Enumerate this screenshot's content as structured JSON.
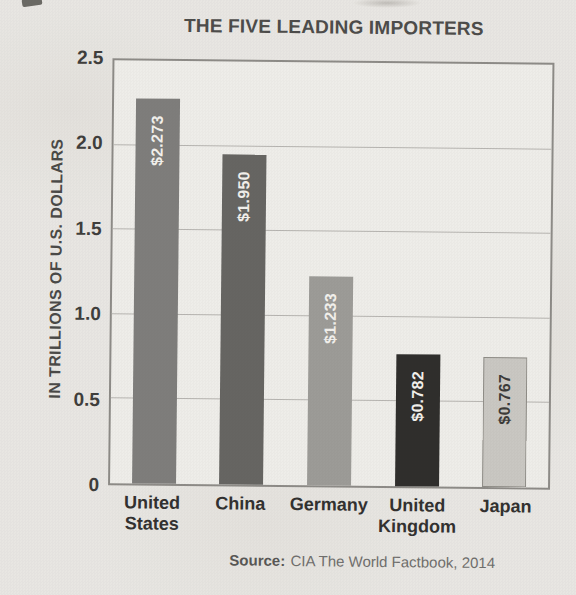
{
  "chart_data": {
    "type": "bar",
    "title": "THE FIVE LEADING IMPORTERS",
    "ylabel": "IN TRILLIONS OF U.S. DOLLARS",
    "xlabel": "",
    "categories": [
      "United States",
      "China",
      "Germany",
      "United Kingdom",
      "Japan"
    ],
    "values": [
      2.273,
      1.95,
      1.233,
      0.782,
      0.767
    ],
    "value_labels": [
      "$2.273",
      "$1.950",
      "$1.233",
      "$0.782",
      "$0.767"
    ],
    "bar_colors": [
      "#7e7d7b",
      "#666562",
      "#9c9b97",
      "#2f2e2c",
      "#c9c7c2"
    ],
    "value_label_colors": [
      "#f2f0ec",
      "#f2f0ec",
      "#f2f0ec",
      "#f2f0ec",
      "#3c3b39"
    ],
    "ylim": [
      0,
      2.5
    ],
    "yticks": [
      {
        "label": "2.5",
        "value": 2.5
      },
      {
        "label": "2.0",
        "value": 2.0
      },
      {
        "label": "1.5",
        "value": 1.5
      },
      {
        "label": "1.0",
        "value": 1.0
      },
      {
        "label": "0.5",
        "value": 0.5
      },
      {
        "label": "0",
        "value": 0
      }
    ],
    "grid": true,
    "legend_position": "none",
    "source": {
      "label": "Source:",
      "text": "CIA The World Factbook, 2014"
    }
  }
}
